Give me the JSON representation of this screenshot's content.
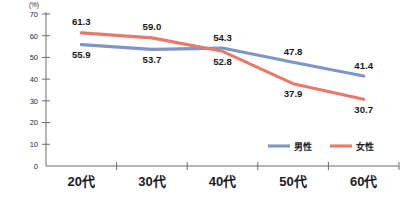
{
  "chart_data": {
    "type": "line",
    "title": "",
    "xlabel": "",
    "ylabel": "(%)",
    "unit_label": "(%)",
    "categories": [
      "20代",
      "30代",
      "40代",
      "50代",
      "60代"
    ],
    "ytick_labels": [
      "0",
      "10",
      "20",
      "30",
      "40",
      "50",
      "60",
      "70"
    ],
    "yticks": [
      0,
      10,
      20,
      30,
      40,
      50,
      60,
      70
    ],
    "ylim": [
      0,
      70
    ],
    "grid": false,
    "legend_position": "bottom-right",
    "series": [
      {
        "name": "男性",
        "color": "#7d96c6",
        "values": [
          55.9,
          53.7,
          54.3,
          47.8,
          41.4
        ],
        "labels": [
          "55.9",
          "53.7",
          "54.3",
          "47.8",
          "41.4"
        ],
        "label_side": [
          "below",
          "below",
          "above",
          "above",
          "above"
        ]
      },
      {
        "name": "女性",
        "color": "#e8796b",
        "values": [
          61.3,
          59.0,
          52.8,
          37.9,
          30.7
        ],
        "labels": [
          "61.3",
          "59.0",
          "52.8",
          "37.9",
          "30.7"
        ],
        "label_side": [
          "above",
          "above",
          "below",
          "below",
          "below"
        ]
      }
    ]
  },
  "legend": {
    "entries": [
      {
        "label": "男性",
        "color": "#7d96c6"
      },
      {
        "label": "女性",
        "color": "#e8796b"
      }
    ]
  },
  "colors": {
    "male": "#7d96c6",
    "female": "#e8796b",
    "axis": "#6b6b6b",
    "text": "#1a1a1a",
    "background": "#ffffff"
  }
}
